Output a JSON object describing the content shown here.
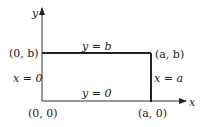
{
  "diagram": {
    "axes": {
      "x_label": "x",
      "y_label": "y"
    },
    "corners": {
      "origin": "(0, 0)",
      "top_left": "(0, b)",
      "top_right": "(a, b)",
      "bottom_right": "(a, 0)"
    },
    "edges": {
      "top": "y = b",
      "bottom": "y = 0",
      "left": "x = 0",
      "right": "x = a"
    }
  }
}
